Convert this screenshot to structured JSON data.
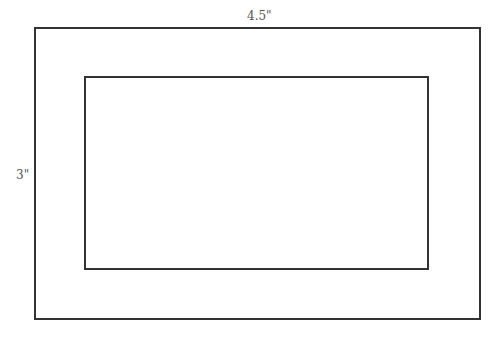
{
  "diagram": {
    "type": "picture-frame",
    "outer_rectangle": {
      "label": "outer-frame"
    },
    "inner_rectangle": {
      "label": "inner-picture"
    },
    "labels": {
      "width": "4.5\"",
      "height": "3\""
    },
    "colors": {
      "stroke": "#333333",
      "text": "#555555",
      "background": "#ffffff"
    }
  }
}
